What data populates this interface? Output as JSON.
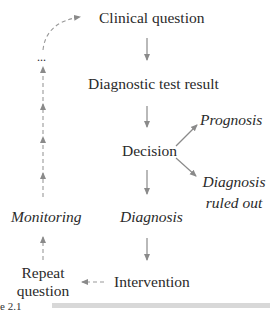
{
  "diagram": {
    "nodes": {
      "clinical_question": "Clinical question",
      "diagnostic_test_result": "Diagnostic test result",
      "decision": "Decision",
      "prognosis": "Prognosis",
      "diagnosis_ruled_out_line1": "Diagnosis",
      "diagnosis_ruled_out_line2": "ruled out",
      "diagnosis": "Diagnosis",
      "intervention": "Intervention",
      "repeat_question_line1": "Repeat",
      "repeat_question_line2": "question",
      "monitoring": "Monitoring",
      "ellipsis": "..."
    },
    "edges": [
      {
        "from": "Clinical question",
        "to": "Diagnostic test result",
        "style": "solid"
      },
      {
        "from": "Diagnostic test result",
        "to": "Decision",
        "style": "solid"
      },
      {
        "from": "Decision",
        "to": "Prognosis",
        "style": "solid"
      },
      {
        "from": "Decision",
        "to": "Diagnosis ruled out",
        "style": "solid"
      },
      {
        "from": "Decision",
        "to": "Diagnosis",
        "style": "solid"
      },
      {
        "from": "Diagnosis",
        "to": "Intervention",
        "style": "solid"
      },
      {
        "from": "Intervention",
        "to": "Repeat question",
        "style": "dashed"
      },
      {
        "from": "Repeat question",
        "to": "Monitoring",
        "style": "dashed"
      },
      {
        "from": "Monitoring",
        "to": "...",
        "style": "dashed"
      },
      {
        "from": "...",
        "to": "Clinical question",
        "style": "dashed"
      }
    ],
    "caption_fragment": "e 2.1",
    "arrow_color": "#8a8a8a"
  }
}
